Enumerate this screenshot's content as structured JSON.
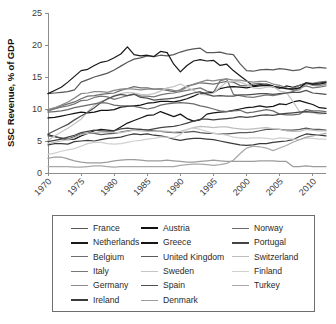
{
  "chart_data": {
    "type": "line",
    "title": "",
    "xlabel": "",
    "ylabel": "SSC Revenue, % of GDP",
    "xlim": [
      1970,
      2012
    ],
    "ylim": [
      0,
      25
    ],
    "grid": false,
    "legend_position": "below-plot",
    "xticks": [
      "1970",
      "1975",
      "1980",
      "1985",
      "1990",
      "1995",
      "2000",
      "2005",
      "2010"
    ],
    "xtick_values": [
      1970,
      1975,
      1980,
      1985,
      1990,
      1995,
      2000,
      2005,
      2010
    ],
    "yticks": [
      "0",
      "5",
      "10",
      "15",
      "20",
      "25"
    ],
    "ytick_values": [
      0,
      5,
      10,
      15,
      20,
      25
    ],
    "x": [
      1970,
      1971,
      1972,
      1973,
      1974,
      1975,
      1976,
      1977,
      1978,
      1979,
      1980,
      1981,
      1982,
      1983,
      1984,
      1985,
      1986,
      1987,
      1988,
      1989,
      1990,
      1991,
      1992,
      1993,
      1994,
      1995,
      1996,
      1997,
      1998,
      1999,
      2000,
      2001,
      2002,
      2003,
      2004,
      2005,
      2006,
      2007,
      2008,
      2009,
      2010,
      2011,
      2012
    ],
    "series": [
      {
        "name": "France",
        "color": "#585858",
        "width": 1.3,
        "values": [
          12.4,
          12.5,
          12.6,
          12.7,
          13.0,
          14.2,
          14.6,
          15.0,
          15.3,
          15.6,
          16.1,
          16.7,
          17.3,
          17.8,
          18.0,
          18.3,
          18.2,
          18.4,
          18.3,
          18.5,
          18.9,
          19.2,
          19.4,
          19.5,
          18.8,
          18.8,
          18.9,
          18.6,
          18.5,
          17.1,
          16.0,
          15.9,
          16.1,
          16.2,
          16.1,
          16.3,
          16.2,
          16.0,
          16.1,
          16.6,
          16.4,
          16.5,
          16.4
        ]
      },
      {
        "name": "Netherlands",
        "color": "#1a1a1a",
        "width": 1.4,
        "values": [
          12.4,
          12.9,
          13.4,
          14.2,
          15.1,
          16.0,
          16.2,
          16.8,
          17.3,
          17.5,
          18.0,
          18.6,
          19.7,
          18.5,
          18.3,
          18.4,
          18.2,
          19.0,
          18.8,
          17.0,
          15.8,
          16.8,
          17.5,
          17.7,
          17.5,
          17.6,
          16.8,
          17.0,
          16.0,
          15.2,
          14.4,
          13.6,
          13.8,
          13.9,
          13.6,
          13.2,
          13.6,
          13.4,
          13.7,
          14.0,
          13.9,
          14.1,
          14.2
        ]
      },
      {
        "name": "Belgium",
        "color": "#6e6e6e",
        "width": 1.25,
        "values": [
          9.8,
          10.1,
          10.5,
          10.8,
          11.1,
          11.6,
          12.0,
          12.1,
          12.3,
          12.4,
          12.5,
          12.9,
          13.2,
          13.5,
          13.3,
          13.3,
          13.1,
          13.1,
          12.9,
          12.7,
          13.0,
          13.6,
          13.8,
          14.1,
          14.0,
          13.9,
          14.1,
          14.3,
          14.2,
          13.7,
          13.6,
          13.9,
          14.0,
          13.8,
          13.4,
          13.3,
          13.2,
          13.2,
          13.7,
          14.1,
          14.0,
          14.2,
          14.3
        ]
      },
      {
        "name": "Italy",
        "color": "#777777",
        "width": 1.25,
        "values": [
          9.7,
          10.0,
          10.3,
          10.5,
          10.8,
          11.3,
          11.4,
          11.8,
          12.0,
          11.9,
          11.5,
          11.8,
          12.1,
          12.4,
          12.0,
          12.0,
          11.9,
          12.2,
          12.4,
          12.5,
          12.7,
          12.9,
          13.1,
          13.3,
          12.8,
          12.6,
          14.4,
          14.7,
          12.3,
          12.1,
          11.9,
          11.8,
          12.0,
          12.2,
          12.1,
          12.3,
          12.5,
          12.7,
          13.3,
          13.6,
          13.3,
          13.4,
          13.6
        ]
      },
      {
        "name": "Germany",
        "color": "#8a8a8a",
        "width": 1.25,
        "values": [
          9.9,
          10.2,
          10.6,
          11.1,
          11.7,
          12.4,
          12.5,
          12.7,
          12.7,
          12.6,
          12.9,
          13.1,
          13.2,
          13.1,
          13.0,
          13.1,
          13.1,
          13.2,
          13.1,
          12.9,
          12.8,
          13.4,
          13.9,
          14.2,
          14.5,
          14.4,
          14.6,
          14.7,
          14.5,
          14.5,
          14.3,
          14.2,
          14.3,
          14.3,
          13.9,
          13.7,
          13.3,
          12.9,
          13.0,
          14.0,
          13.7,
          13.6,
          13.9
        ]
      },
      {
        "name": "Ireland",
        "color": "#3a3a3a",
        "width": 1.3,
        "values": [
          4.4,
          4.6,
          4.6,
          4.5,
          4.9,
          5.0,
          5.1,
          5.0,
          5.2,
          5.4,
          5.5,
          5.6,
          5.9,
          6.1,
          6.0,
          6.1,
          5.9,
          5.8,
          5.6,
          5.3,
          5.1,
          5.3,
          5.4,
          5.4,
          5.3,
          5.2,
          5.0,
          4.8,
          4.6,
          4.4,
          4.3,
          4.4,
          4.6,
          4.6,
          4.8,
          4.9,
          5.0,
          5.2,
          5.7,
          6.1,
          6.0,
          5.9,
          5.8
        ]
      },
      {
        "name": "Austria",
        "color": "#111111",
        "width": 1.4,
        "values": [
          8.6,
          8.7,
          8.9,
          9.1,
          9.3,
          9.5,
          9.4,
          9.5,
          9.8,
          9.8,
          9.9,
          10.3,
          10.4,
          10.5,
          10.6,
          10.9,
          11.0,
          11.2,
          11.2,
          11.1,
          11.3,
          11.6,
          12.0,
          12.5,
          12.5,
          12.6,
          13.2,
          13.4,
          13.5,
          13.4,
          13.3,
          13.5,
          13.6,
          13.7,
          13.5,
          13.4,
          13.2,
          13.1,
          13.3,
          14.1,
          13.9,
          13.9,
          14.1
        ]
      },
      {
        "name": "Greece",
        "color": "#151515",
        "width": 1.4,
        "values": [
          6.0,
          5.7,
          5.4,
          5.2,
          5.3,
          5.8,
          6.2,
          6.6,
          6.8,
          6.7,
          6.6,
          7.2,
          7.8,
          8.2,
          8.6,
          9.0,
          9.1,
          9.6,
          9.2,
          8.8,
          9.2,
          8.5,
          8.1,
          8.3,
          9.2,
          9.4,
          9.5,
          9.6,
          9.8,
          10.0,
          10.2,
          10.3,
          10.5,
          10.3,
          10.4,
          10.8,
          10.7,
          11.1,
          11.3,
          11.0,
          10.7,
          10.2,
          10.1
        ]
      },
      {
        "name": "United Kingdom",
        "color": "#5a5a5a",
        "width": 1.25,
        "values": [
          5.8,
          5.7,
          5.5,
          5.3,
          5.7,
          6.1,
          6.2,
          6.2,
          6.0,
          6.1,
          6.2,
          6.4,
          6.6,
          6.7,
          6.8,
          6.7,
          6.6,
          6.5,
          6.4,
          6.3,
          6.3,
          6.4,
          6.5,
          6.3,
          6.2,
          6.2,
          6.1,
          6.1,
          6.2,
          6.3,
          6.3,
          6.4,
          6.6,
          6.8,
          6.8,
          6.8,
          6.7,
          6.7,
          6.8,
          7.0,
          6.8,
          6.8,
          6.7
        ]
      },
      {
        "name": "Sweden",
        "color": "#c4c4c4",
        "width": 1.25,
        "values": [
          5.1,
          5.8,
          6.4,
          7.0,
          7.7,
          8.4,
          9.6,
          10.6,
          11.2,
          11.5,
          12.1,
          12.4,
          12.6,
          12.5,
          12.3,
          12.2,
          12.4,
          12.8,
          13.3,
          13.5,
          13.9,
          13.4,
          12.9,
          12.3,
          12.2,
          12.5,
          13.4,
          14.2,
          14.4,
          14.2,
          13.8,
          13.3,
          13.2,
          13.4,
          13.5,
          12.8,
          12.6,
          11.2,
          9.6,
          9.5,
          9.4,
          9.2,
          9.3
        ]
      },
      {
        "name": "Spain",
        "color": "#4f4f4f",
        "width": 1.3,
        "values": [
          6.1,
          6.6,
          7.1,
          7.6,
          8.3,
          8.9,
          9.5,
          10.2,
          11.0,
          11.6,
          12.0,
          12.3,
          12.1,
          12.3,
          11.8,
          11.7,
          11.4,
          11.5,
          11.6,
          11.7,
          11.9,
          12.2,
          12.5,
          12.7,
          12.3,
          12.0,
          12.1,
          12.0,
          12.0,
          12.2,
          12.2,
          12.3,
          12.4,
          12.4,
          12.3,
          12.4,
          12.5,
          12.6,
          12.6,
          12.9,
          12.5,
          12.4,
          12.3
        ]
      },
      {
        "name": "Denmark",
        "color": "#9c9c9c",
        "width": 1.25,
        "values": [
          2.3,
          2.5,
          2.5,
          2.2,
          1.9,
          1.7,
          1.6,
          1.6,
          1.6,
          1.7,
          1.9,
          2.0,
          2.1,
          2.1,
          2.0,
          1.9,
          1.9,
          1.9,
          2.0,
          1.9,
          1.8,
          1.7,
          1.7,
          1.8,
          1.9,
          2.0,
          1.9,
          1.8,
          1.8,
          1.8,
          1.8,
          1.8,
          1.9,
          1.9,
          1.9,
          1.8,
          1.8,
          1.0,
          1.0,
          1.1,
          1.0,
          1.0,
          1.0
        ]
      },
      {
        "name": "Norway",
        "color": "#6a6a6a",
        "width": 1.25,
        "values": [
          9.5,
          9.6,
          9.7,
          9.9,
          10.2,
          10.4,
          10.6,
          10.8,
          11.0,
          10.9,
          10.6,
          10.5,
          10.5,
          10.4,
          10.2,
          10.0,
          10.2,
          10.6,
          10.8,
          10.9,
          11.0,
          10.9,
          10.8,
          10.5,
          10.3,
          10.0,
          9.7,
          9.6,
          9.7,
          9.8,
          9.4,
          9.5,
          9.7,
          9.9,
          9.7,
          9.2,
          9.1,
          9.1,
          9.2,
          9.9,
          9.7,
          9.7,
          9.6
        ]
      },
      {
        "name": "Portugal",
        "color": "#444444",
        "width": 1.3,
        "values": [
          4.9,
          5.1,
          5.3,
          5.6,
          5.9,
          6.3,
          6.5,
          6.7,
          6.6,
          6.5,
          6.6,
          6.9,
          7.0,
          6.9,
          6.8,
          6.7,
          6.9,
          7.1,
          7.2,
          7.3,
          7.5,
          7.8,
          8.1,
          8.4,
          8.4,
          8.3,
          8.4,
          8.5,
          8.6,
          8.8,
          8.7,
          8.8,
          9.0,
          9.1,
          9.0,
          9.2,
          9.3,
          9.4,
          9.5,
          9.6,
          9.5,
          9.4,
          9.3
        ]
      },
      {
        "name": "Switzerland",
        "color": "#bdbdbd",
        "width": 1.25,
        "values": [
          4.6,
          4.8,
          5.0,
          5.2,
          5.5,
          6.0,
          6.2,
          6.3,
          6.4,
          6.4,
          6.3,
          6.3,
          6.5,
          6.7,
          6.6,
          6.5,
          6.5,
          6.6,
          6.5,
          6.4,
          6.5,
          6.8,
          7.1,
          7.3,
          7.2,
          7.1,
          7.2,
          7.2,
          7.0,
          6.9,
          6.8,
          6.9,
          7.0,
          7.1,
          6.9,
          6.8,
          6.6,
          6.5,
          6.5,
          6.8,
          6.7,
          6.6,
          6.6
        ]
      },
      {
        "name": "Finland",
        "color": "#d0d0d0",
        "width": 1.25,
        "values": [
          2.9,
          3.1,
          3.4,
          3.6,
          3.8,
          4.2,
          4.6,
          4.8,
          4.8,
          4.6,
          4.5,
          4.6,
          4.8,
          5.0,
          5.1,
          5.3,
          5.4,
          5.6,
          5.6,
          5.5,
          6.0,
          6.8,
          7.0,
          6.8,
          6.5,
          6.2,
          6.1,
          5.9,
          5.6,
          5.5,
          5.4,
          5.5,
          5.5,
          5.4,
          5.3,
          5.5,
          5.4,
          5.3,
          5.2,
          5.5,
          5.4,
          5.3,
          5.3
        ]
      },
      {
        "name": "Turkey",
        "color": "#a8a8a8",
        "width": 1.25,
        "values": [
          1.0,
          1.0,
          1.0,
          1.0,
          0.9,
          0.9,
          1.0,
          1.1,
          1.1,
          1.0,
          0.9,
          1.0,
          1.0,
          1.0,
          1.0,
          1.0,
          1.0,
          1.0,
          1.0,
          1.0,
          1.2,
          1.3,
          1.4,
          1.4,
          1.3,
          1.2,
          1.3,
          1.5,
          2.0,
          3.0,
          3.9,
          4.2,
          4.1,
          3.9,
          3.5,
          3.9,
          4.3,
          4.8,
          5.2,
          5.6,
          5.8,
          6.0,
          6.2
        ]
      }
    ]
  },
  "legend": {
    "columns": [
      [
        {
          "label": "France",
          "color": "#585858",
          "weight": 1.6
        },
        {
          "label": "Netherlands",
          "color": "#1a1a1a",
          "weight": 2.1
        },
        {
          "label": "Belgium",
          "color": "#6e6e6e",
          "weight": 1.6
        },
        {
          "label": "Italy",
          "color": "#777777",
          "weight": 1.5
        },
        {
          "label": "Germany",
          "color": "#8a8a8a",
          "weight": 1.7
        },
        {
          "label": "Ireland",
          "color": "#3a3a3a",
          "weight": 2.0
        }
      ],
      [
        {
          "label": "Austria",
          "color": "#111111",
          "weight": 2.2
        },
        {
          "label": "Greece",
          "color": "#151515",
          "weight": 2.2
        },
        {
          "label": "United Kingdom",
          "color": "#5a5a5a",
          "weight": 1.8
        },
        {
          "label": "Sweden",
          "color": "#c4c4c4",
          "weight": 1.5
        },
        {
          "label": "Spain",
          "color": "#4f4f4f",
          "weight": 1.9
        },
        {
          "label": "Denmark",
          "color": "#9c9c9c",
          "weight": 1.5
        }
      ],
      [
        {
          "label": "Norway",
          "color": "#6a6a6a",
          "weight": 1.6
        },
        {
          "label": "Portugal",
          "color": "#444444",
          "weight": 2.0
        },
        {
          "label": "Switzerland",
          "color": "#bdbdbd",
          "weight": 1.5
        },
        {
          "label": "Finland",
          "color": "#d0d0d0",
          "weight": 1.5
        },
        {
          "label": "Turkey",
          "color": "#a8a8a8",
          "weight": 1.5
        }
      ]
    ]
  }
}
